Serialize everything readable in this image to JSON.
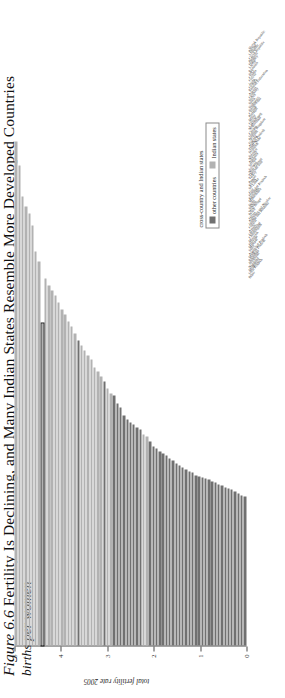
{
  "figure": {
    "number": "Figure 6.6",
    "headline": "Fertility Is Declining, and Many Indian States Resemble More Developed Countries",
    "subtitle": "births per women"
  },
  "legend": {
    "title": "cross-country and Indian states",
    "items": [
      {
        "label": "other countries",
        "color": "#707070",
        "key": "other"
      },
      {
        "label": "Indian states",
        "color": "#b2b2b2",
        "key": "indian"
      }
    ]
  },
  "chart_data": {
    "type": "bar",
    "orientation": "horizontal",
    "title": "Fertility Is Declining, and Many Indian States Resemble More Developed Countries",
    "subtitle": "births per women",
    "xlabel": "",
    "ylabel": "total fertility rate 2005",
    "ylim": [
      0,
      5
    ],
    "yticks": [
      0,
      1,
      2,
      3,
      4,
      5
    ],
    "ytick_labels": [
      "0",
      "1",
      "2",
      "3",
      "4",
      "5"
    ],
    "grid": false,
    "legend_position": "bottom-right",
    "highlight": "India",
    "series": [
      {
        "name": "other countries",
        "color": "#707070"
      },
      {
        "name": "Indian states",
        "color": "#b2b2b2"
      }
    ],
    "categories": [
      "Slovak Republic",
      "Poland",
      "Lithuania",
      "Czech Republic",
      "Bulgaria",
      "Hungary",
      "Latvia",
      "Romania",
      "Italy",
      "Croatia",
      "Greece",
      "Japan",
      "Georgia",
      "Russian Federation",
      "Austria",
      "Germany",
      "Serbia",
      "Spain",
      "Singapore",
      "Switzerland",
      "Cyprus",
      "Portugal",
      "Malta",
      "Greece",
      "Luxembourg",
      "Netherlands",
      "Canada",
      "United Kingdom",
      "Belgium",
      "Finland",
      "Andhra Pradesh",
      "Tamil Nadu",
      "Denmark",
      "Sweden",
      "Norway",
      "Australia",
      "Ireland",
      "Iceland",
      "New Zealand",
      "Thailand/Iran",
      "Turkey",
      "Punjab",
      "Kerala",
      "Sri Lanka",
      "Goa",
      "Himachal Pradesh",
      "Karnataka",
      "Maharashtra",
      "Delhi",
      "Sikkim",
      "West Bengal",
      "Brazil",
      "Orissa",
      "Andaman and Nicobar",
      "Jammu and Kashmir",
      "Gujarat",
      "Assam",
      "Uttaranchal",
      "Chhattisgarh",
      "Mizoram",
      "Haryana",
      "Manipur",
      "India",
      "Arunachal Pradesh",
      "Madhya Pradesh",
      "Rajasthan",
      "Jharkhand",
      "Nagaland",
      "Meghalaya",
      "Uttar Pradesh",
      "Bihar"
    ],
    "values": [
      1.24,
      1.25,
      1.27,
      1.28,
      1.3,
      1.31,
      1.32,
      1.33,
      1.34,
      1.36,
      1.37,
      1.38,
      1.39,
      1.4,
      1.41,
      1.42,
      1.44,
      1.45,
      1.47,
      1.48,
      1.5,
      1.52,
      1.54,
      1.56,
      1.58,
      1.6,
      1.62,
      1.64,
      1.66,
      1.7,
      1.74,
      1.76,
      1.8,
      1.82,
      1.84,
      1.86,
      1.88,
      1.92,
      1.98,
      2.02,
      2.08,
      2.1,
      2.14,
      2.2,
      2.24,
      2.28,
      2.32,
      2.38,
      2.42,
      2.46,
      2.5,
      2.54,
      2.6,
      2.66,
      2.7,
      2.76,
      2.8,
      2.86,
      2.92,
      2.96,
      3.0,
      3.06,
      2.68,
      3.2,
      3.28,
      3.5,
      3.6,
      3.66,
      3.74,
      4.0,
      4.2
    ],
    "group": [
      "other",
      "other",
      "other",
      "other",
      "other",
      "other",
      "other",
      "other",
      "other",
      "other",
      "other",
      "other",
      "other",
      "other",
      "other",
      "other",
      "other",
      "other",
      "other",
      "other",
      "other",
      "other",
      "other",
      "other",
      "other",
      "other",
      "other",
      "other",
      "other",
      "other",
      "indian",
      "indian",
      "other",
      "other",
      "other",
      "other",
      "other",
      "other",
      "other",
      "other",
      "other",
      "indian",
      "indian",
      "other",
      "indian",
      "indian",
      "indian",
      "indian",
      "indian",
      "indian",
      "indian",
      "other",
      "indian",
      "indian",
      "indian",
      "indian",
      "indian",
      "indian",
      "indian",
      "indian",
      "indian",
      "indian",
      "indian",
      "indian",
      "indian",
      "indian",
      "indian",
      "indian",
      "indian",
      "indian",
      "indian"
    ]
  }
}
